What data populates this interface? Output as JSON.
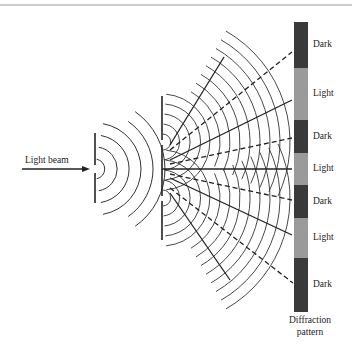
{
  "diagram": {
    "beam_label": "Light beam",
    "pattern_caption_line1": "Diffraction",
    "pattern_caption_line2": "pattern",
    "colors": {
      "dark": "#3a3a3a",
      "light": "#9a9a9a",
      "line": "#222222"
    },
    "pattern_bands": [
      {
        "label": "Dark",
        "tone": "dark",
        "y0": 22,
        "y1": 68
      },
      {
        "label": "Light",
        "tone": "light",
        "y0": 68,
        "y1": 120
      },
      {
        "label": "Dark",
        "tone": "dark",
        "y0": 120,
        "y1": 153
      },
      {
        "label": "Light",
        "tone": "light",
        "y0": 153,
        "y1": 185
      },
      {
        "label": "Dark",
        "tone": "dark",
        "y0": 185,
        "y1": 218
      },
      {
        "label": "Light",
        "tone": "light",
        "y0": 218,
        "y1": 258
      },
      {
        "label": "Dark",
        "tone": "dark",
        "y0": 258,
        "y1": 312
      }
    ]
  }
}
